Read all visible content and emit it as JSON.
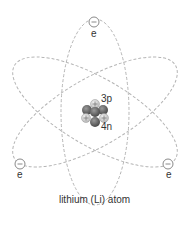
{
  "title": "lithium (Li) atom",
  "nucleus": {
    "protons_label": "3p",
    "neutrons_label": "4n",
    "proton_count": 3,
    "neutron_count": 4
  },
  "electrons": [
    {
      "label": "e",
      "position": "top"
    },
    {
      "label": "e",
      "position": "bottom-left"
    },
    {
      "label": "e",
      "position": "bottom-right"
    }
  ],
  "colors": {
    "orbit": "#b0b0b0",
    "proton_fill": "#d8d8d8",
    "neutron_fill": "#6e6e6e",
    "electron_stroke": "#8a8a8a",
    "text": "#333333"
  }
}
